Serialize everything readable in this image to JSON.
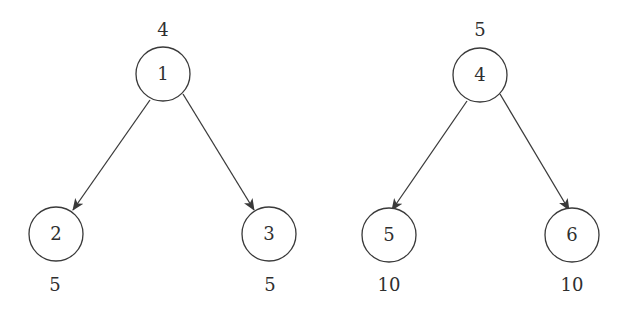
{
  "diagram": {
    "type": "tree",
    "colors": {
      "stroke": "#3a3a3a",
      "text": "#2f2f2f",
      "background": "#ffffff"
    },
    "trees": [
      {
        "nodes": [
          {
            "id": "1",
            "label": "1",
            "weight": "4",
            "cx": 163,
            "cy": 74
          },
          {
            "id": "2",
            "label": "2",
            "weight": "5",
            "cx": 56,
            "cy": 234
          },
          {
            "id": "3",
            "label": "3",
            "weight": "5",
            "cx": 269,
            "cy": 234
          }
        ],
        "edges": [
          {
            "from": "1",
            "to": "2"
          },
          {
            "from": "1",
            "to": "3"
          }
        ]
      },
      {
        "nodes": [
          {
            "id": "4",
            "label": "4",
            "weight": "5",
            "cx": 480,
            "cy": 75
          },
          {
            "id": "5",
            "label": "5",
            "weight": "10",
            "cx": 389,
            "cy": 235
          },
          {
            "id": "6",
            "label": "6",
            "weight": "10",
            "cx": 572,
            "cy": 235
          }
        ],
        "edges": [
          {
            "from": "4",
            "to": "5"
          },
          {
            "from": "4",
            "to": "6"
          }
        ]
      }
    ]
  }
}
